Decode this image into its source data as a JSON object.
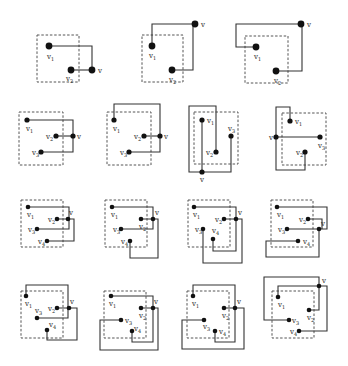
{
  "figure": {
    "title": "",
    "colors": {
      "line": "#333333",
      "box": "#555555",
      "vertex": "#111111",
      "background": "#ffffff"
    },
    "panels": [
      {
        "id": "r1c1",
        "box": [
          37,
          35,
          42,
          47
        ],
        "vertices": [
          {
            "label": "v1",
            "x": 49,
            "y": 46,
            "r": 3.4,
            "lx": 47,
            "ly": 59
          },
          {
            "label": "v2",
            "x": 71,
            "y": 70,
            "r": 3.4,
            "lx": 66,
            "ly": 81
          },
          {
            "label": "v",
            "x": 92,
            "y": 70,
            "r": 3.4,
            "lx": 98,
            "ly": 73
          }
        ],
        "edges": [
          "M49 46 H92 V70",
          "M71 70 H92"
        ]
      },
      {
        "id": "r1c2",
        "box": [
          142,
          35,
          41,
          47
        ],
        "vertices": [
          {
            "label": "v1",
            "x": 152,
            "y": 46,
            "r": 3.4,
            "lx": 149,
            "ly": 58
          },
          {
            "label": "v2",
            "x": 172,
            "y": 70,
            "r": 3.4,
            "lx": 169,
            "ly": 82
          },
          {
            "label": "v",
            "x": 195,
            "y": 24,
            "r": 3.4,
            "lx": 201,
            "ly": 27
          }
        ],
        "edges": [
          "M152 46 V24 H195",
          "M172 70 H193 V24"
        ]
      },
      {
        "id": "r1c3",
        "box": [
          245,
          36,
          43,
          47
        ],
        "vertices": [
          {
            "label": "v1",
            "x": 256,
            "y": 47,
            "r": 3.4,
            "lx": 254,
            "ly": 59
          },
          {
            "label": "v2",
            "x": 276,
            "y": 71,
            "r": 3.4,
            "lx": 274,
            "ly": 83
          },
          {
            "label": "v",
            "x": 301,
            "y": 24,
            "r": 3.4,
            "lx": 307,
            "ly": 27
          }
        ],
        "edges": [
          "M256 47 H236 V24 H301",
          "M276 71 H302 V24"
        ]
      },
      {
        "id": "r2c1",
        "box": [
          19,
          112,
          44,
          53
        ],
        "vertices": [
          {
            "label": "v1",
            "x": 27,
            "y": 120,
            "r": 2.6,
            "lx": 26,
            "ly": 131
          },
          {
            "label": "v2",
            "x": 56,
            "y": 136,
            "r": 2.6,
            "lx": 46,
            "ly": 139
          },
          {
            "label": "v",
            "x": 73,
            "y": 136,
            "r": 2.6,
            "lx": 77,
            "ly": 139
          },
          {
            "label": "v3",
            "x": 41,
            "y": 152,
            "r": 2.6,
            "lx": 32,
            "ly": 155
          }
        ],
        "edges": [
          "M27 120 H73 V152 H41",
          "M56 136 H73"
        ]
      },
      {
        "id": "r2c2",
        "box": [
          107,
          112,
          44,
          53
        ],
        "vertices": [
          {
            "label": "v1",
            "x": 114,
            "y": 120,
            "r": 2.6,
            "lx": 113,
            "ly": 131
          },
          {
            "label": "v2",
            "x": 144,
            "y": 136,
            "r": 2.6,
            "lx": 134,
            "ly": 139
          },
          {
            "label": "v",
            "x": 160,
            "y": 136,
            "r": 2.6,
            "lx": 164,
            "ly": 139
          },
          {
            "label": "v3",
            "x": 129,
            "y": 152,
            "r": 2.6,
            "lx": 120,
            "ly": 155
          }
        ],
        "edges": [
          "M114 120 V104 H160 V152 H129",
          "M144 136 H160"
        ]
      },
      {
        "id": "r2c3",
        "box": [
          194,
          112,
          44,
          52
        ],
        "vertices": [
          {
            "label": "v1",
            "x": 202,
            "y": 120,
            "r": 2.6,
            "lx": 207,
            "ly": 123
          },
          {
            "label": "v3",
            "x": 231,
            "y": 136,
            "r": 2.6,
            "lx": 228,
            "ly": 131
          },
          {
            "label": "v2",
            "x": 216,
            "y": 152,
            "r": 2.6,
            "lx": 206,
            "ly": 155
          },
          {
            "label": "v",
            "x": 202,
            "y": 172,
            "r": 2.6,
            "lx": 200,
            "ly": 182
          }
        ],
        "edges": [
          "M202 120 V172",
          "M216 152 V106 H189 V172 H231 V136"
        ]
      },
      {
        "id": "r2c4",
        "box": [
          282,
          113,
          44,
          52
        ],
        "vertices": [
          {
            "label": "v1",
            "x": 290,
            "y": 121,
            "r": 2.6,
            "lx": 295,
            "ly": 124
          },
          {
            "label": "v",
            "x": 276,
            "y": 137,
            "r": 2.6,
            "lx": 269,
            "ly": 140
          },
          {
            "label": "v3",
            "x": 320,
            "y": 137,
            "r": 2.6,
            "lx": 318,
            "ly": 148
          },
          {
            "label": "v2",
            "x": 305,
            "y": 152,
            "r": 2.6,
            "lx": 296,
            "ly": 155
          }
        ],
        "edges": [
          "M290 121 V107 H276 V170 H305 V152",
          "M276 137 H320"
        ]
      },
      {
        "id": "r3c1",
        "box": [
          21,
          200,
          42,
          47
        ],
        "vertices": [
          {
            "label": "v1",
            "x": 28,
            "y": 207,
            "r": 2.3,
            "lx": 27,
            "ly": 217
          },
          {
            "label": "v2",
            "x": 57,
            "y": 219,
            "r": 2.3,
            "lx": 48,
            "ly": 222
          },
          {
            "label": "v",
            "x": 68,
            "y": 219,
            "r": 2.3,
            "lx": 69,
            "ly": 215
          },
          {
            "label": "v3",
            "x": 37,
            "y": 229,
            "r": 2.3,
            "lx": 28,
            "ly": 232
          },
          {
            "label": "v4",
            "x": 47,
            "y": 241,
            "r": 2.3,
            "lx": 38,
            "ly": 244
          }
        ],
        "edges": [
          "M28 207 H69 V229 H37",
          "M57 219 H74 V241 H47"
        ]
      },
      {
        "id": "r3c2",
        "box": [
          105,
          200,
          42,
          47
        ],
        "vertices": [
          {
            "label": "v1",
            "x": 112,
            "y": 207,
            "r": 2.3,
            "lx": 111,
            "ly": 217
          },
          {
            "label": "v2",
            "x": 141,
            "y": 219,
            "r": 2.3,
            "lx": 139,
            "ly": 229
          },
          {
            "label": "v",
            "x": 153,
            "y": 219,
            "r": 2.3,
            "lx": 155,
            "ly": 215
          },
          {
            "label": "v3",
            "x": 121,
            "y": 229,
            "r": 2.3,
            "lx": 113,
            "ly": 232
          },
          {
            "label": "v4",
            "x": 130,
            "y": 241,
            "r": 2.3,
            "lx": 121,
            "ly": 244
          }
        ],
        "edges": [
          "M112 207 H153 V229 H121",
          "M141 219 H158 V258 H130 V241"
        ]
      },
      {
        "id": "r3c3",
        "box": [
          188,
          200,
          42,
          47
        ],
        "vertices": [
          {
            "label": "v1",
            "x": 194,
            "y": 207,
            "r": 2.3,
            "lx": 193,
            "ly": 217
          },
          {
            "label": "v2",
            "x": 224,
            "y": 219,
            "r": 2.3,
            "lx": 215,
            "ly": 222
          },
          {
            "label": "v",
            "x": 236,
            "y": 219,
            "r": 2.3,
            "lx": 238,
            "ly": 215
          },
          {
            "label": "v3",
            "x": 203,
            "y": 229,
            "r": 2.3,
            "lx": 195,
            "ly": 232
          },
          {
            "label": "v4",
            "x": 213,
            "y": 239,
            "r": 2.3,
            "lx": 212,
            "ly": 233
          },
          {
            "label": "",
            "x": 0,
            "y": 0,
            "r": 0,
            "lx": 0,
            "ly": 0
          }
        ],
        "edges": [
          "M194 207 H236 V251 H213 V239",
          "M224 219 H242 V263 H203 V229"
        ]
      },
      {
        "id": "r3c4",
        "box": [
          271,
          200,
          42,
          47
        ],
        "vertices": [
          {
            "label": "v1",
            "x": 277,
            "y": 207,
            "r": 2.3,
            "lx": 277,
            "ly": 217
          },
          {
            "label": "v2",
            "x": 308,
            "y": 219,
            "r": 2.3,
            "lx": 299,
            "ly": 222
          },
          {
            "label": "v",
            "x": 319,
            "y": 229,
            "r": 2.3,
            "lx": 321,
            "ly": 226
          },
          {
            "label": "v3",
            "x": 287,
            "y": 229,
            "r": 2.3,
            "lx": 278,
            "ly": 232
          },
          {
            "label": "v4",
            "x": 298,
            "y": 241,
            "r": 2.3,
            "lx": 303,
            "ly": 244
          }
        ],
        "edges": [
          "M277 207 H327 V229 H287",
          "M308 219 H322 V229",
          "M319 229 V257 H266 V241 H298"
        ]
      },
      {
        "id": "r4c1",
        "box": [
          21,
          291,
          42,
          47
        ],
        "vertices": [
          {
            "label": "v1",
            "x": 26,
            "y": 296,
            "r": 2.3,
            "lx": 25,
            "ly": 306
          },
          {
            "label": "v2",
            "x": 57,
            "y": 308,
            "r": 2.3,
            "lx": 48,
            "ly": 311
          },
          {
            "label": "v",
            "x": 69,
            "y": 308,
            "r": 2.3,
            "lx": 70,
            "ly": 304
          },
          {
            "label": "v3",
            "x": 37,
            "y": 318,
            "r": 2.3,
            "lx": 35,
            "ly": 313
          },
          {
            "label": "v4",
            "x": 47,
            "y": 330,
            "r": 2.3,
            "lx": 49,
            "ly": 327
          }
        ],
        "edges": [
          "M26 296 V285 H68 V318 H37",
          "M57 308 H77 V340 H47 V330"
        ]
      },
      {
        "id": "r4c2",
        "box": [
          104,
          291,
          42,
          47
        ],
        "vertices": [
          {
            "label": "v1",
            "x": 111,
            "y": 296,
            "r": 2.3,
            "lx": 109,
            "ly": 306
          },
          {
            "label": "v2",
            "x": 141,
            "y": 308,
            "r": 2.3,
            "lx": 139,
            "ly": 318
          },
          {
            "label": "v",
            "x": 153,
            "y": 308,
            "r": 2.3,
            "lx": 154,
            "ly": 304
          },
          {
            "label": "v3",
            "x": 121,
            "y": 320,
            "r": 2.3,
            "lx": 125,
            "ly": 323
          },
          {
            "label": "v4",
            "x": 132,
            "y": 331,
            "r": 2.3,
            "lx": 134,
            "ly": 331
          }
        ],
        "edges": [
          "M111 296 H153 V342 H132 V331",
          "M141 308 H158 V350 H100 V320 H121"
        ]
      },
      {
        "id": "r4c3",
        "box": [
          187,
          291,
          42,
          47
        ],
        "vertices": [
          {
            "label": "v1",
            "x": 193,
            "y": 296,
            "r": 2.3,
            "lx": 192,
            "ly": 306
          },
          {
            "label": "v2",
            "x": 224,
            "y": 308,
            "r": 2.3,
            "lx": 222,
            "ly": 318
          },
          {
            "label": "v",
            "x": 235,
            "y": 308,
            "r": 2.3,
            "lx": 237,
            "ly": 304
          },
          {
            "label": "v3",
            "x": 204,
            "y": 320,
            "r": 2.3,
            "lx": 203,
            "ly": 329
          },
          {
            "label": "v4",
            "x": 215,
            "y": 331,
            "r": 2.3,
            "lx": 219,
            "ly": 334
          }
        ],
        "edges": [
          "M193 296 V285 H235 V342 H215 V331",
          "M224 308 H244 V349 H182 V320 H204"
        ]
      },
      {
        "id": "r4c4",
        "box": [
          272,
          291,
          42,
          47
        ],
        "vertices": [
          {
            "label": "v1",
            "x": 278,
            "y": 297,
            "r": 2.3,
            "lx": 278,
            "ly": 307
          },
          {
            "label": "v2",
            "x": 309,
            "y": 310,
            "r": 2.3,
            "lx": 307,
            "ly": 320
          },
          {
            "label": "v",
            "x": 319,
            "y": 286,
            "r": 2.3,
            "lx": 322,
            "ly": 283
          },
          {
            "label": "v3",
            "x": 289,
            "y": 320,
            "r": 2.3,
            "lx": 292,
            "ly": 323
          },
          {
            "label": "v4",
            "x": 299,
            "y": 331,
            "r": 2.3,
            "lx": 290,
            "ly": 334
          }
        ],
        "edges": [
          "M289 320 H264 V277 H319 V286",
          "M278 297 V286 H327 V331 H299",
          "M309 310 H319 V286"
        ]
      }
    ]
  }
}
